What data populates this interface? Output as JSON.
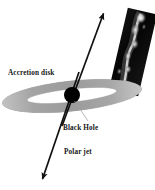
{
  "figure": {
    "width": 155,
    "height": 190,
    "background_color": "#ffffff"
  },
  "labels": {
    "accretion_disk": "Accretion disk",
    "black_hole": "Black Hole",
    "polar_jet": "Polar jet"
  },
  "colors": {
    "background": "#ffffff",
    "disk_fill": "#a9a9a9",
    "disk_edge": "#8c8c8c",
    "disk_inner": "#ffffff",
    "black_hole": "#000000",
    "jet_arrow": "#111111",
    "pointer_line": "#9a9a9a",
    "text": "#151515",
    "inset_background": "#0a0a0a",
    "inset_jet_bright": "#f2f2f2"
  },
  "components": {
    "accretion_disk": {
      "name": "accretion-disk",
      "shape": "ellipse-annulus",
      "center_x": 72,
      "center_y": 96,
      "radius_x": 70,
      "radius_y": 15,
      "inner_radius_x": 45,
      "inner_radius_y": 7,
      "rotation_deg": -6
    },
    "black_hole": {
      "name": "black-hole",
      "shape": "circle",
      "center_x": 72,
      "center_y": 95,
      "radius": 8
    },
    "polar_jet_upper": {
      "name": "polar-jet-upper",
      "from_x": 62,
      "from_y": 126,
      "to_x": 103,
      "to_y": 13,
      "arrowhead": "end"
    },
    "polar_jet_lower": {
      "name": "polar-jet-lower",
      "from_x": 79,
      "from_y": 72,
      "to_x": 42,
      "to_y": 180,
      "arrowhead": "end"
    },
    "pointer_black_hole": {
      "name": "black-hole-pointer",
      "from_x": 74,
      "from_y": 101,
      "to_x": 88,
      "to_y": 120
    },
    "inset_photo": {
      "name": "jet-photograph-inset",
      "description": "telescope photograph of an astrophysical jet",
      "center_x": 133,
      "center_y": 52,
      "width": 30,
      "height": 84,
      "rotation_deg": 13
    }
  },
  "label_positions": {
    "accretion_disk": {
      "x": 8,
      "y": 75
    },
    "black_hole": {
      "x": 63,
      "y": 129
    },
    "polar_jet": {
      "x": 64,
      "y": 153
    }
  }
}
